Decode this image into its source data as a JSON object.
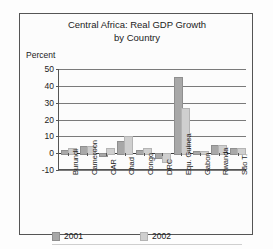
{
  "chart_data": {
    "type": "bar",
    "title": "Central Africa: Real GDP Growth by Country",
    "title_lines": [
      "Central Africa: Real GDP Growth",
      "by Country"
    ],
    "xlabel": "",
    "ylabel": "Percent",
    "ylim": [
      -10,
      50
    ],
    "yticks": [
      50,
      40,
      30,
      20,
      10,
      0,
      -10
    ],
    "ytick_labels": [
      "50",
      "40",
      "30",
      "20",
      "10",
      "0",
      "-10"
    ],
    "grid": true,
    "legend_position": "bottom-left",
    "categories": [
      "Burundi",
      "Cameroon",
      "CAR",
      "Chad",
      "Congo",
      "DRC",
      "Equ. Guinea",
      "Gabon",
      "Rwanda",
      "São T."
    ],
    "series": [
      {
        "name": "2001",
        "color": "#a8a8a8",
        "values": [
          2.0,
          4.5,
          -0.8,
          7.0,
          2.0,
          -2.0,
          45.0,
          1.0,
          5.0,
          3.0
        ]
      },
      {
        "name": "2002",
        "color": "#cfcfcf",
        "values": [
          3.0,
          4.5,
          3.0,
          10.0,
          3.0,
          -4.5,
          27.0,
          1.5,
          5.0,
          3.0
        ]
      }
    ]
  },
  "legend": {
    "entries": [
      {
        "label": "2001"
      },
      {
        "label": "2002"
      }
    ]
  },
  "colors": {
    "series_2001": "#a8a8a8",
    "series_2002": "#cfcfcf",
    "frame": "#555555",
    "gridline": "#7a7a7a",
    "text": "#1b1b1b",
    "background": "#fdfdfd"
  }
}
